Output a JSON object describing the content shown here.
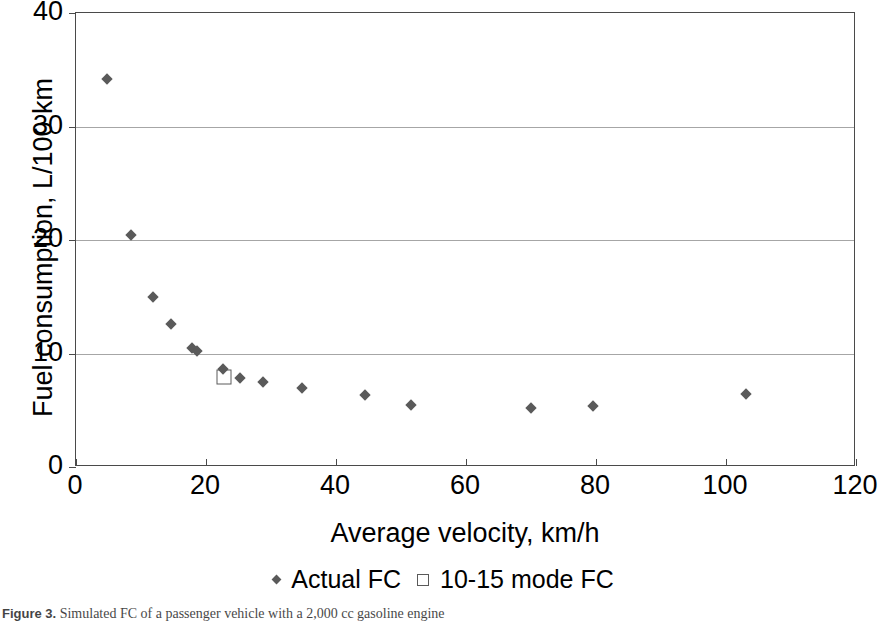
{
  "figure": {
    "caption_label": "Figure 3.",
    "caption_text": "Simulated FC of a passenger vehicle with a 2,000 cc gasoline engine"
  },
  "chart_data": {
    "type": "scatter",
    "title": "",
    "xlabel": "Average velocity, km/h",
    "ylabel": "Fuel consumption, L/100 km",
    "xlim": [
      0,
      120
    ],
    "ylim": [
      0,
      40
    ],
    "xticks": [
      0,
      20,
      40,
      60,
      80,
      100,
      120
    ],
    "yticks": [
      0,
      10,
      20,
      30,
      40
    ],
    "xticklabels": [
      "0",
      "20",
      "40",
      "60",
      "80",
      "100",
      "120"
    ],
    "yticklabels": [
      "0",
      "10",
      "20",
      "30",
      "40"
    ],
    "grid": "horizontal",
    "legend_position": "bottom-center",
    "series": [
      {
        "name": "Actual FC",
        "marker": "diamond",
        "color": "#5a5a5a",
        "points": [
          [
            4.8,
            34.2
          ],
          [
            8.5,
            20.4
          ],
          [
            11.8,
            15.0
          ],
          [
            14.6,
            12.6
          ],
          [
            17.8,
            10.5
          ],
          [
            18.6,
            10.2
          ],
          [
            22.6,
            8.6
          ],
          [
            25.2,
            7.8
          ],
          [
            28.8,
            7.5
          ],
          [
            34.8,
            7.0
          ],
          [
            44.5,
            6.3
          ],
          [
            51.5,
            5.5
          ],
          [
            70.0,
            5.2
          ],
          [
            79.5,
            5.4
          ],
          [
            103.0,
            6.4
          ]
        ]
      },
      {
        "name": "10-15 mode FC",
        "marker": "square-open",
        "color": "#5a5a5a",
        "points": [
          [
            22.8,
            7.9
          ]
        ]
      }
    ]
  },
  "colors": {
    "marker": "#5a5a5a",
    "axis": "#4a4a4a",
    "gridline": "#a6a6a6",
    "background": "#ffffff",
    "text": "#000000"
  }
}
